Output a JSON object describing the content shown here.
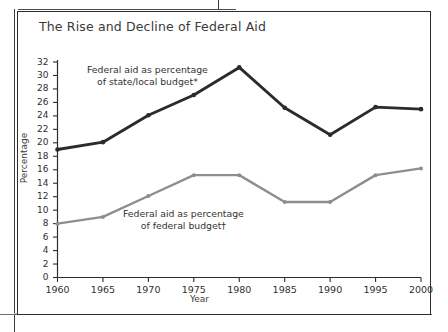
{
  "figure": {
    "title": "The Rise and Decline of Federal Aid"
  },
  "axes": {
    "y_title": "Percentage",
    "x_title": "Year"
  },
  "annotations": {
    "upper_line1": "Federal aid as percentage",
    "upper_line2": "of state/local budget*",
    "lower_line1": "Federal aid as percentage",
    "lower_line2": "of federal budget†"
  },
  "colors": {
    "series_state_local": "#2b2b2b",
    "series_federal": "#8e8e8e",
    "frame": "#2d2d2d",
    "text": "#333333"
  },
  "chart_data": {
    "type": "line",
    "title": "The Rise and Decline of Federal Aid",
    "xlabel": "Year",
    "ylabel": "Percentage",
    "xlim": [
      1960,
      2000
    ],
    "ylim": [
      0,
      32
    ],
    "ytick_step": 2,
    "xtick_step": 5,
    "grid": false,
    "legend": "inline-annotations",
    "categories": [
      1960,
      1965,
      1970,
      1975,
      1980,
      1985,
      1990,
      1995,
      2000
    ],
    "x_tick_labels": [
      "1960",
      "1965",
      "1970",
      "1975",
      "1980",
      "1985",
      "1990",
      "1995",
      "2000"
    ],
    "y_tick_labels": [
      "0",
      "2",
      "4",
      "6",
      "8",
      "10",
      "12",
      "14",
      "16",
      "18",
      "20",
      "22",
      "24",
      "26",
      "28",
      "30",
      "32"
    ],
    "series": [
      {
        "name": "Federal aid as percentage of state/local budget*",
        "color": "#2b2b2b",
        "values": [
          19.0,
          20.1,
          24.1,
          27.1,
          31.2,
          25.2,
          21.2,
          25.3,
          25.0
        ]
      },
      {
        "name": "Federal aid as percentage of federal budget†",
        "color": "#8e8e8e",
        "values": [
          8.0,
          9.0,
          12.1,
          15.2,
          15.2,
          11.2,
          11.2,
          15.2,
          16.2
        ]
      }
    ]
  }
}
